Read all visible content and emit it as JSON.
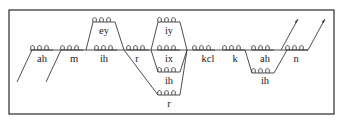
{
  "diagram": {
    "type": "phone pronunciation network (HMM states)",
    "main_path": [
      "ah",
      "m",
      "ih",
      "r",
      "ix",
      "kcl",
      "k",
      "ah",
      "n"
    ],
    "alternatives": [
      {
        "position": 3,
        "phone": "ey",
        "replaces": "ih"
      },
      {
        "position": 5,
        "phone": "iy",
        "replaces": "ix"
      },
      {
        "position": 5,
        "phone": "ih",
        "replaces": "ix"
      },
      {
        "position": 4,
        "phone": "r",
        "replaces": "r ix",
        "note": "skip arc from ih to r branch"
      },
      {
        "position": 8,
        "phone": "ih",
        "replaces": "ah"
      }
    ],
    "labels": {
      "ah1": "ah",
      "m": "m",
      "ih": "ih",
      "ey": "ey",
      "r": "r",
      "iy": "iy",
      "ix": "ix",
      "ih2": "ih",
      "r2": "r",
      "kcl": "kcl",
      "k": "k",
      "ah2": "ah",
      "ih3": "ih",
      "n": "n"
    }
  }
}
